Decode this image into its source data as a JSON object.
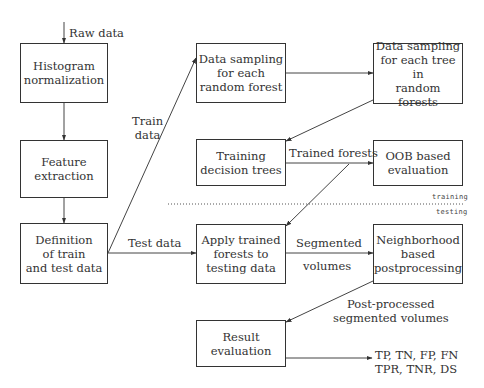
{
  "diagram": {
    "type": "flowchart",
    "nodes": {
      "histogram": {
        "label": "Histogram\nnormalization"
      },
      "feature": {
        "label": "Feature\nextraction"
      },
      "definition": {
        "label": "Definition\nof train\nand test data"
      },
      "sampling_forest": {
        "label": "Data sampling\nfor each\nrandom forest"
      },
      "sampling_tree": {
        "label": "Data sampling\nfor each tree in\nrandom forests"
      },
      "training": {
        "label": "Training\ndecision trees"
      },
      "oob": {
        "label": "OOB based\nevaluation"
      },
      "apply": {
        "label": "Apply trained\nforests to\ntesting data"
      },
      "neighborhood": {
        "label": "Neighborhood\nbased\npostprocessing"
      },
      "result": {
        "label": "Result\nevaluation"
      }
    },
    "edge_labels": {
      "raw_data": "Raw data",
      "train_data": "Train\ndata",
      "test_data": "Test data",
      "trained_forests": "Trained forests",
      "segmented": "Segmented",
      "volumes": "volumes",
      "post_processed": "Post-processed\nsegmented volumes",
      "metrics": "TP, TN, FP, FN\nTPR, TNR, DS"
    },
    "phases": {
      "training": "training",
      "testing": "testing"
    },
    "edges": [
      {
        "from": "input",
        "to": "histogram",
        "label": "Raw data"
      },
      {
        "from": "histogram",
        "to": "feature"
      },
      {
        "from": "feature",
        "to": "definition"
      },
      {
        "from": "definition",
        "to": "sampling_forest",
        "label": "Train data"
      },
      {
        "from": "definition",
        "to": "apply",
        "label": "Test data"
      },
      {
        "from": "sampling_forest",
        "to": "sampling_tree"
      },
      {
        "from": "sampling_tree",
        "to": "training"
      },
      {
        "from": "training",
        "to": "oob",
        "label": "Trained forests"
      },
      {
        "from": "training",
        "to": "apply",
        "label": "Trained forests"
      },
      {
        "from": "apply",
        "to": "neighborhood",
        "label": "Segmented volumes"
      },
      {
        "from": "neighborhood",
        "to": "result",
        "label": "Post-processed segmented volumes"
      },
      {
        "from": "result",
        "to": "output",
        "label": "TP, TN, FP, FN, TPR, TNR, DS"
      }
    ]
  }
}
